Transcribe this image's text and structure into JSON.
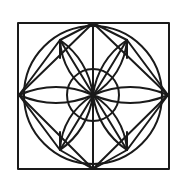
{
  "diagram": {
    "type": "geometric-rosette",
    "stroke_color": "#1a1a1a",
    "background": "#ffffff",
    "center": [
      93,
      95
    ],
    "square": {
      "x": 18,
      "y": 23,
      "width": 151,
      "height": 146
    },
    "diamond": [
      [
        93,
        23
      ],
      [
        168,
        95
      ],
      [
        93,
        169
      ],
      [
        19,
        95
      ]
    ],
    "outer_circle_r": 69,
    "inner_circle_r": 26,
    "petal_tips": [
      [
        19,
        95
      ],
      [
        168,
        95
      ],
      [
        60,
        40
      ],
      [
        127,
        40
      ],
      [
        60,
        150
      ],
      [
        127,
        150
      ]
    ]
  }
}
